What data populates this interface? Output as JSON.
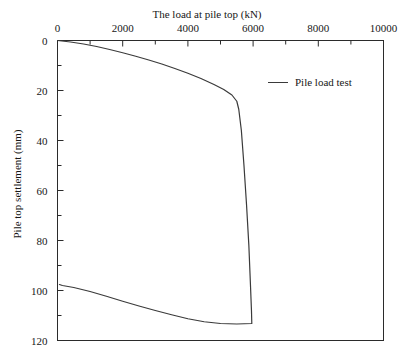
{
  "chart_data": {
    "type": "line",
    "title": "",
    "xlabel": "The load at pile top (kN)",
    "ylabel": "Pile top settlement (mm)",
    "xlim": [
      0,
      10000
    ],
    "ylim": [
      0,
      120
    ],
    "y_axis_inverted": true,
    "x_axis_position": "top",
    "grid": false,
    "legend_position": "upper-right-inside",
    "xticks": [
      0,
      2000,
      4000,
      6000,
      8000,
      10000
    ],
    "xtick_labels": [
      "0",
      "2000",
      "4000",
      "6000",
      "8000",
      "10000"
    ],
    "x_minor_ticks": [
      1000,
      3000,
      5000,
      7000,
      9000
    ],
    "yticks": [
      0,
      20,
      40,
      60,
      80,
      100,
      120
    ],
    "ytick_labels": [
      "0",
      "20",
      "40",
      "60",
      "80",
      "100",
      "120"
    ],
    "y_minor_ticks": [
      10,
      30,
      50,
      70,
      90,
      110
    ],
    "series": [
      {
        "name": "Pile load test",
        "color": "#3a3a3a",
        "points": [
          [
            0,
            0.0
          ],
          [
            400,
            0.6
          ],
          [
            800,
            1.4
          ],
          [
            1200,
            2.4
          ],
          [
            1600,
            3.6
          ],
          [
            2000,
            4.9
          ],
          [
            2400,
            6.3
          ],
          [
            2800,
            7.8
          ],
          [
            3200,
            9.4
          ],
          [
            3600,
            11.2
          ],
          [
            4000,
            13.1
          ],
          [
            4400,
            15.2
          ],
          [
            4800,
            17.6
          ],
          [
            5100,
            19.6
          ],
          [
            5350,
            21.8
          ],
          [
            5500,
            24.3
          ],
          [
            5560,
            27.5
          ],
          [
            5640,
            36.0
          ],
          [
            5720,
            50.0
          ],
          [
            5800,
            66.0
          ],
          [
            5870,
            82.0
          ],
          [
            5920,
            98.0
          ],
          [
            5950,
            108.0
          ],
          [
            5960,
            113.2
          ],
          [
            5500,
            113.4
          ],
          [
            5000,
            113.2
          ],
          [
            4500,
            112.5
          ],
          [
            4000,
            111.3
          ],
          [
            3500,
            109.7
          ],
          [
            3000,
            108.0
          ],
          [
            2500,
            106.2
          ],
          [
            2000,
            104.3
          ],
          [
            1500,
            102.3
          ],
          [
            1000,
            100.4
          ],
          [
            500,
            98.8
          ],
          [
            150,
            98.0
          ],
          [
            60,
            97.6
          ]
        ]
      }
    ]
  },
  "legend": {
    "entries": [
      {
        "label": "Pile load test"
      }
    ]
  }
}
